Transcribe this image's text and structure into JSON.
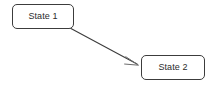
{
  "diagram": {
    "background_color": "#ffffff",
    "stroke_color": "#3c3c3c",
    "arrowhead_color": "#6d6d6d",
    "text_color": "#2b2b2b",
    "nodes": [
      {
        "id": "state-1",
        "label": "State 1",
        "shape": "rounded-rectangle",
        "x": 12,
        "y": 4,
        "width": 62,
        "height": 25
      },
      {
        "id": "state-2",
        "label": "State 2",
        "shape": "rounded-rectangle",
        "x": 141,
        "y": 55,
        "width": 64,
        "height": 25
      }
    ],
    "edges": [
      {
        "id": "edge-state-1-to-state-2",
        "from": "state-1",
        "to": "state-2",
        "label": "",
        "style": "solid",
        "arrowhead": "open",
        "start_x": 70,
        "start_y": 28,
        "end_x": 139,
        "end_y": 65
      }
    ]
  }
}
